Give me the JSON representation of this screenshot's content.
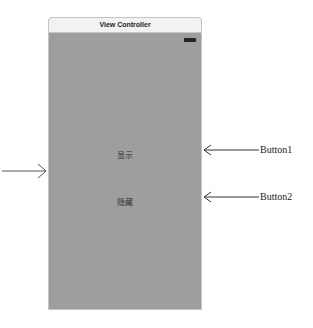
{
  "scene": {
    "title": "View Controller",
    "buttons": [
      {
        "label": "显示"
      },
      {
        "label": "隐藏"
      }
    ]
  },
  "annotations": [
    {
      "label": "Button1"
    },
    {
      "label": "Button2"
    }
  ],
  "colors": {
    "view_background": "#9e9e9e",
    "title_bar": "#f2f2f2"
  }
}
